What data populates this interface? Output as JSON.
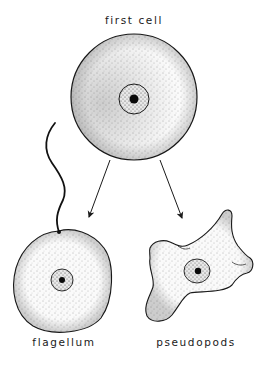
{
  "diagram": {
    "title_label": "first cell",
    "nodes": [
      {
        "id": "first-cell",
        "label": "first cell",
        "shape": "round cell with nucleus"
      },
      {
        "id": "flagellate-cell",
        "label": "flagellum",
        "shape": "round cell with whip-like flagellum"
      },
      {
        "id": "amoeboid-cell",
        "label": "pseudopods",
        "shape": "irregular cell with pseudopod lobes"
      }
    ],
    "edges": [
      {
        "from": "first-cell",
        "to": "flagellate-cell",
        "style": "arrow"
      },
      {
        "from": "first-cell",
        "to": "amoeboid-cell",
        "style": "arrow"
      }
    ],
    "labels": {
      "top": "first cell",
      "bottom_left": "flagellum",
      "bottom_right": "pseudopods"
    },
    "colors": {
      "background": "#ffffff",
      "ink": "#1a1a1a",
      "stipple": "#555555"
    }
  }
}
